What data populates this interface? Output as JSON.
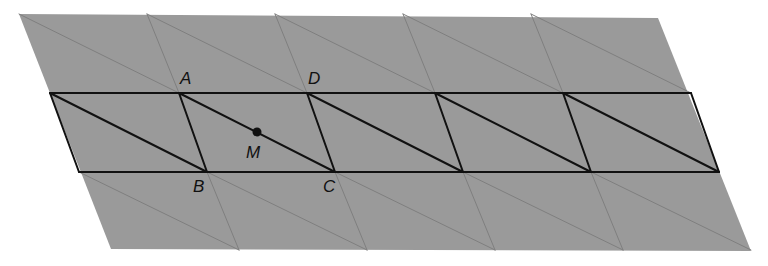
{
  "diagram": {
    "colors": {
      "background": "#ffffff",
      "fill": "#9a9a9a",
      "faint_line": "#7f7f7f",
      "bold_line": "#111111",
      "point": "#111111",
      "label": "#111111"
    },
    "outer_region": {
      "corners": [
        [
          19,
          14
        ],
        [
          658,
          18
        ],
        [
          751,
          251
        ],
        [
          111,
          249
        ]
      ]
    },
    "rows": {
      "top_y": 14,
      "band_top_y": 93,
      "band_bottom_y": 172,
      "bottom_y": 250
    },
    "band": {
      "top_x": [
        50,
        179,
        307,
        435,
        563,
        691
      ],
      "bottom_x": [
        79,
        207,
        335,
        463,
        591,
        719
      ]
    },
    "upper_row": {
      "top_x": [
        19,
        147,
        275,
        403,
        531,
        658
      ],
      "bottom_x": [
        50,
        179,
        307,
        435,
        563,
        691
      ]
    },
    "lower_row": {
      "top_x": [
        79,
        207,
        335,
        463,
        591,
        719
      ],
      "bottom_x": [
        111,
        239,
        367,
        495,
        623,
        751
      ]
    },
    "points": [
      {
        "name": "A",
        "x": 179,
        "y": 93,
        "label_x": 180,
        "label_y": 84
      },
      {
        "name": "D",
        "x": 307,
        "y": 93,
        "label_x": 308,
        "label_y": 84
      },
      {
        "name": "B",
        "x": 207,
        "y": 172,
        "label_x": 193,
        "label_y": 192
      },
      {
        "name": "C",
        "x": 335,
        "y": 172,
        "label_x": 323,
        "label_y": 192
      },
      {
        "name": "M",
        "x": 257,
        "y": 132,
        "label_x": 246,
        "label_y": 158,
        "marked": true
      }
    ]
  }
}
